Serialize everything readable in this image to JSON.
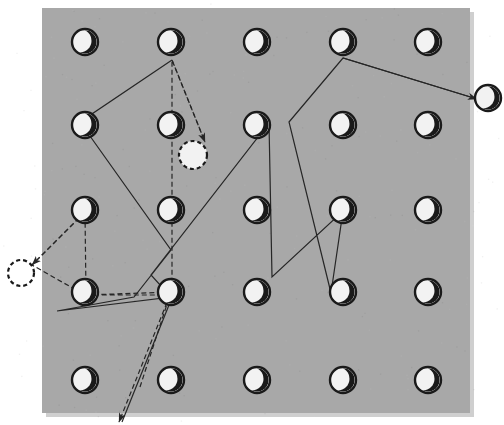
{
  "canvas": {
    "width": 504,
    "height": 425,
    "background_color": "#ffffff"
  },
  "panel": {
    "label": "grid-panel",
    "x": 42,
    "y": 8,
    "width": 428,
    "height": 405,
    "fill_color": "#a8a8a8",
    "shadow_color": "#cfcfcf"
  },
  "style": {
    "node_stroke_color": "#1a1a1a",
    "node_fill_color": "#f2f2f2",
    "crescent_color": "#1a1a1a",
    "path_solid_color": "#262626",
    "path_dashed_color": "#262626",
    "path_stroke_width": 1.2,
    "node_radius": 13,
    "node_ring_width": 2.4,
    "ghost_dash_pattern": "4,3"
  },
  "grid": {
    "label": "moon-node-grid",
    "rows": 5,
    "cols": 5,
    "icon_name": "crescent-moon-icon",
    "col_x": [
      85,
      171,
      257,
      343,
      428
    ],
    "row_y": [
      42,
      125,
      210,
      292,
      380
    ],
    "nodes": [
      {
        "id": "r1c1",
        "row": 1,
        "col": 1,
        "x": 85,
        "y": 42,
        "state": "filled"
      },
      {
        "id": "r1c2",
        "row": 1,
        "col": 2,
        "x": 171,
        "y": 42,
        "state": "filled"
      },
      {
        "id": "r1c3",
        "row": 1,
        "col": 3,
        "x": 257,
        "y": 42,
        "state": "filled"
      },
      {
        "id": "r1c4",
        "row": 1,
        "col": 4,
        "x": 343,
        "y": 42,
        "state": "filled"
      },
      {
        "id": "r1c5",
        "row": 1,
        "col": 5,
        "x": 428,
        "y": 42,
        "state": "filled"
      },
      {
        "id": "r2c1",
        "row": 2,
        "col": 1,
        "x": 85,
        "y": 125,
        "state": "filled"
      },
      {
        "id": "r2c2",
        "row": 2,
        "col": 2,
        "x": 171,
        "y": 125,
        "state": "filled"
      },
      {
        "id": "r2c3",
        "row": 2,
        "col": 3,
        "x": 257,
        "y": 125,
        "state": "filled"
      },
      {
        "id": "r2c4",
        "row": 2,
        "col": 4,
        "x": 343,
        "y": 125,
        "state": "filled"
      },
      {
        "id": "r2c5",
        "row": 2,
        "col": 5,
        "x": 428,
        "y": 125,
        "state": "filled"
      },
      {
        "id": "r3c1",
        "row": 3,
        "col": 1,
        "x": 85,
        "y": 210,
        "state": "filled"
      },
      {
        "id": "r3c2",
        "row": 3,
        "col": 2,
        "x": 171,
        "y": 210,
        "state": "filled"
      },
      {
        "id": "r3c3",
        "row": 3,
        "col": 3,
        "x": 257,
        "y": 210,
        "state": "filled"
      },
      {
        "id": "r3c4",
        "row": 3,
        "col": 4,
        "x": 343,
        "y": 210,
        "state": "filled"
      },
      {
        "id": "r3c5",
        "row": 3,
        "col": 5,
        "x": 428,
        "y": 210,
        "state": "filled"
      },
      {
        "id": "r4c1",
        "row": 4,
        "col": 1,
        "x": 85,
        "y": 292,
        "state": "filled"
      },
      {
        "id": "r4c2",
        "row": 4,
        "col": 2,
        "x": 171,
        "y": 292,
        "state": "filled"
      },
      {
        "id": "r4c3",
        "row": 4,
        "col": 3,
        "x": 257,
        "y": 292,
        "state": "filled"
      },
      {
        "id": "r4c4",
        "row": 4,
        "col": 4,
        "x": 343,
        "y": 292,
        "state": "filled"
      },
      {
        "id": "r4c5",
        "row": 4,
        "col": 5,
        "x": 428,
        "y": 292,
        "state": "filled"
      },
      {
        "id": "r5c1",
        "row": 5,
        "col": 1,
        "x": 85,
        "y": 380,
        "state": "filled"
      },
      {
        "id": "r5c2",
        "row": 5,
        "col": 2,
        "x": 171,
        "y": 380,
        "state": "filled"
      },
      {
        "id": "r5c3",
        "row": 5,
        "col": 3,
        "x": 257,
        "y": 380,
        "state": "filled"
      },
      {
        "id": "r5c4",
        "row": 5,
        "col": 4,
        "x": 343,
        "y": 380,
        "state": "filled"
      },
      {
        "id": "r5c5",
        "row": 5,
        "col": 5,
        "x": 428,
        "y": 380,
        "state": "filled"
      }
    ]
  },
  "ghost_nodes": [
    {
      "id": "ghost-center",
      "label": "ghost-node-interior",
      "x": 193,
      "y": 155,
      "r": 14
    },
    {
      "id": "ghost-left",
      "label": "ghost-node-left-exterior",
      "x": 21,
      "y": 273,
      "r": 13
    }
  ],
  "external_nodes": [
    {
      "id": "ext-right",
      "label": "external-moon-right",
      "x": 488,
      "y": 98,
      "state": "filled"
    }
  ],
  "paths": {
    "solid": {
      "label": "solid-trajectory",
      "stroke": "#262626",
      "dash": "none",
      "points": [
        [
          172,
          60
        ],
        [
          80,
          122
        ],
        [
          171,
          250
        ],
        [
          134,
          297
        ],
        [
          57,
          311
        ],
        [
          171,
          297
        ],
        [
          151,
          275
        ],
        [
          269,
          123
        ],
        [
          272,
          277
        ],
        [
          343,
          211
        ],
        [
          331,
          293
        ],
        [
          289,
          122
        ],
        [
          343,
          58
        ],
        [
          477,
          99
        ]
      ]
    },
    "dashed": {
      "label": "dashed-trajectory",
      "stroke": "#262626",
      "dash": "5,3",
      "points": [
        [
          140,
          387
        ],
        [
          170,
          295
        ],
        [
          86,
          295
        ],
        [
          85,
          212
        ],
        [
          32,
          265
        ],
        [
          85,
          295
        ],
        [
          172,
          292
        ],
        [
          172,
          60
        ],
        [
          205,
          142
        ]
      ]
    }
  },
  "arrows": [
    {
      "id": "arrow-to-ghost-center",
      "label": "arrow-to-interior-ghost",
      "from": [
        172,
        60
      ],
      "to": [
        205,
        142
      ],
      "style": "dashed"
    },
    {
      "id": "arrow-to-ghost-left",
      "label": "arrow-to-left-ghost",
      "from": [
        85,
        212
      ],
      "to": [
        32,
        265
      ],
      "style": "dashed"
    },
    {
      "id": "arrow-to-ext-right",
      "label": "arrow-to-external-moon",
      "from": [
        343,
        58
      ],
      "to": [
        477,
        99
      ],
      "style": "solid"
    },
    {
      "id": "arrow-bottom-exit",
      "label": "arrow-bottom-exit",
      "from": [
        170,
        295
      ],
      "to": [
        119,
        422
      ],
      "style": "dashed-double"
    }
  ]
}
